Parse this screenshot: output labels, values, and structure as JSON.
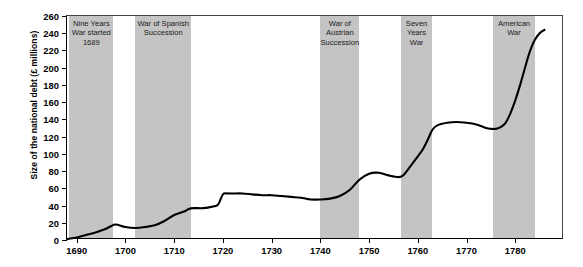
{
  "chart_data": {
    "type": "line",
    "title": "",
    "xlabel": "",
    "ylabel": "Size of the national debt (£ millions)",
    "xlim": [
      1688,
      1790
    ],
    "ylim": [
      0,
      260
    ],
    "ytick_step": 20,
    "yticks": [
      0,
      20,
      40,
      60,
      80,
      100,
      120,
      140,
      160,
      180,
      200,
      220,
      240,
      260
    ],
    "xticks": [
      1690,
      1700,
      1710,
      1720,
      1730,
      1740,
      1750,
      1760,
      1770,
      1780
    ],
    "grid": false,
    "legend": "none",
    "line_color": "#000000",
    "band_color": "#c4c4c4",
    "series": [
      {
        "name": "National debt",
        "x": [
          1688,
          1690,
          1692,
          1694,
          1695,
          1696,
          1697,
          1698,
          1700,
          1702,
          1704,
          1706,
          1708,
          1710,
          1712,
          1713,
          1714,
          1716,
          1718,
          1719,
          1720,
          1721,
          1722,
          1724,
          1726,
          1728,
          1730,
          1732,
          1734,
          1736,
          1738,
          1740,
          1742,
          1744,
          1746,
          1748,
          1750,
          1752,
          1754,
          1756,
          1757,
          1758,
          1760,
          1761,
          1762,
          1763,
          1764,
          1766,
          1768,
          1770,
          1772,
          1774,
          1775,
          1776,
          1777,
          1778,
          1779,
          1780,
          1781,
          1782,
          1783,
          1784,
          1785,
          1786
        ],
        "values": [
          1,
          3,
          6,
          9,
          11,
          13,
          16,
          18,
          15,
          14,
          15,
          17,
          22,
          29,
          33,
          36,
          37,
          37,
          39,
          41,
          53,
          54,
          54,
          54,
          53,
          52,
          52,
          51,
          50,
          49,
          47,
          47,
          48,
          51,
          58,
          70,
          77,
          78,
          75,
          73,
          75,
          82,
          97,
          105,
          116,
          128,
          133,
          136,
          137,
          136,
          134,
          130,
          129,
          129,
          131,
          136,
          147,
          162,
          180,
          200,
          219,
          232,
          240,
          244
        ]
      }
    ],
    "bands": [
      {
        "label": "Nine Years War started 1689",
        "start": 1688.5,
        "end": 1697.5
      },
      {
        "label": "War of Spanish Succession",
        "start": 1702,
        "end": 1713.5
      },
      {
        "label": "War of Austrian Succession",
        "start": 1740,
        "end": 1748
      },
      {
        "label": "Seven Years War",
        "start": 1756.5,
        "end": 1763
      },
      {
        "label": "American War",
        "start": 1775.5,
        "end": 1784
      }
    ]
  }
}
